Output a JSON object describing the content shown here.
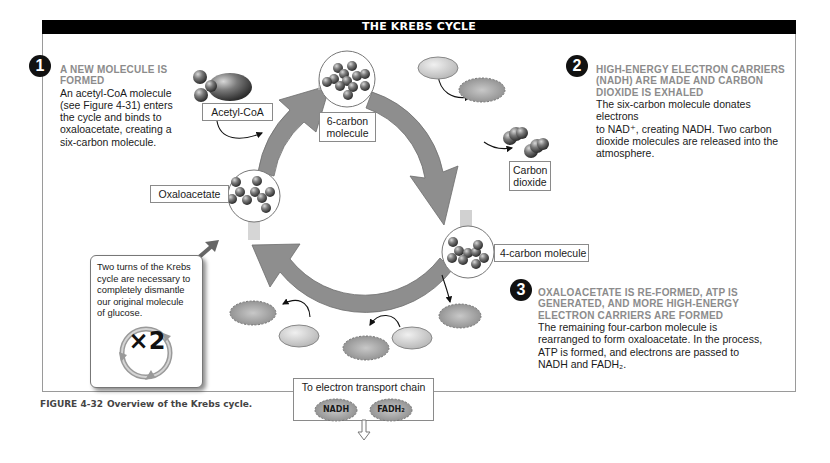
{
  "title": "THE KREBS CYCLE",
  "steps": [
    {
      "number": "1",
      "heading_line1": "A NEW MOLECULE IS",
      "heading_line2": "FORMED",
      "body_lines": [
        "An acetyl-CoA molecule",
        "(see Figure 4-31) enters",
        "the cycle and binds to",
        "oxaloacetate, creating a",
        "six-carbon molecule."
      ]
    },
    {
      "number": "2",
      "heading_lines": [
        "HIGH-ENERGY ELECTRON CARRIERS",
        "(NADH) ARE MADE AND CARBON",
        "DIOXIDE IS EXHALED"
      ],
      "body_lines": [
        "The six-carbon molecule donates electrons",
        "to NAD⁺, creating NADH.  Two carbon",
        "dioxide molecules are released into the",
        "atmosphere."
      ]
    },
    {
      "number": "3",
      "heading_lines": [
        "OXALOACETATE IS RE-FORMED, ATP IS",
        "GENERATED, AND MORE HIGH-ENERGY",
        "ELECTRON CARRIERS ARE FORMED"
      ],
      "body_lines": [
        "The remaining four-carbon molecule is",
        "rearranged to form oxaloacetate. In the process,",
        "ATP is formed, and electrons are passed to",
        "NADH and FADH₂."
      ]
    }
  ],
  "molecules": {
    "acetyl_coa": "Acetyl-CoA",
    "six_carbon_line1": "6-carbon",
    "six_carbon_line2": "molecule",
    "carbon_dioxide_line1": "Carbon",
    "carbon_dioxide_line2": "dioxide",
    "four_carbon": "4-carbon molecule",
    "oxaloacetate": "Oxaloacetate"
  },
  "carriers": {
    "nad_plus_top": "NAD⁺",
    "nadh_top": "NADH",
    "atp": "ATP",
    "nad_plus_bottom": "NAD⁺",
    "nadh_bottom": "NADH",
    "fad": "FAD",
    "fadh2": "FADH₂"
  },
  "note": {
    "text_lines": [
      "Two turns of the Krebs",
      "cycle are necessary to",
      "completely dismantle",
      "our original molecule",
      "of glucose."
    ],
    "multiplier": "×2"
  },
  "electron_transport": {
    "title": "To electron transport chain",
    "items": [
      "NADH",
      "FADH₂"
    ]
  },
  "caption": {
    "number": "FIGURE 4-32",
    "text": "Overview of the Krebs cycle."
  },
  "colors": {
    "title_bar": "#000000",
    "heading_gray": "#8c8c8c",
    "arrow_gray": "#8e8e8e",
    "oval_fill": "#d0d0d0",
    "badge_fill": "#a8a8a8"
  }
}
